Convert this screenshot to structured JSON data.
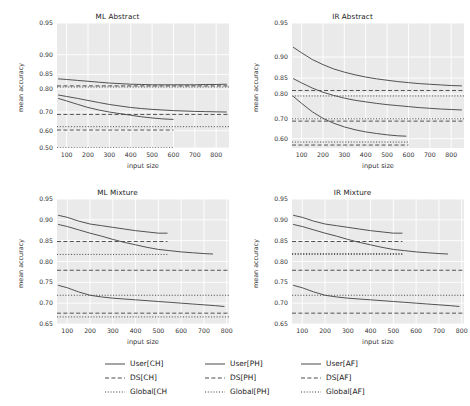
{
  "figure": {
    "width": 470,
    "height": 406,
    "background": "#ffffff",
    "panel_background": "#eaeaea",
    "grid_color": "#ffffff",
    "line_color": "#4a4a4a"
  },
  "legend": {
    "position": "bottom-center",
    "columns": 3,
    "entries": [
      {
        "label": "User[CH]",
        "style": "solid",
        "icon": "solid-line-icon"
      },
      {
        "label": "User[PH]",
        "style": "solid",
        "icon": "solid-line-icon"
      },
      {
        "label": "User[AF]",
        "style": "solid",
        "icon": "solid-line-icon"
      },
      {
        "label": "DS[CH]",
        "style": "dashed",
        "icon": "dashed-line-icon"
      },
      {
        "label": "DS[PH]",
        "style": "dashed",
        "icon": "dashed-line-icon"
      },
      {
        "label": "DS[AF]",
        "style": "dashed",
        "icon": "dashed-line-icon"
      },
      {
        "label": "Global[CH",
        "style": "dotted",
        "icon": "dotted-line-icon"
      },
      {
        "label": "Global[PH]",
        "style": "dotted",
        "icon": "dotted-line-icon"
      },
      {
        "label": "Global[AF]",
        "style": "dotted",
        "icon": "dotted-line-icon"
      }
    ]
  },
  "chart_data": [
    {
      "type": "line",
      "title": "ML Abstract",
      "xlabel": "input size",
      "ylabel": "mean accuracy",
      "grid": true,
      "xlim": [
        55,
        860
      ],
      "xticks": [
        100,
        200,
        300,
        400,
        500,
        600,
        700,
        800
      ],
      "yscale": "logit-like",
      "ylim": [
        0.5,
        0.95
      ],
      "yticks": [
        0.95,
        0.9,
        0.85,
        0.8,
        0.7,
        0.6,
        0.5
      ],
      "series": [
        {
          "name": "User[CH]",
          "style": "solid",
          "x": [
            60,
            100,
            150,
            200,
            250,
            300,
            350,
            400,
            450,
            500,
            550,
            600,
            650,
            700,
            750,
            800,
            850
          ],
          "y": [
            0.836,
            0.834,
            0.831,
            0.828,
            0.825,
            0.822,
            0.82,
            0.818,
            0.817,
            0.816,
            0.816,
            0.816,
            0.816,
            0.816,
            0.817,
            0.817,
            0.818
          ]
        },
        {
          "name": "User[PH]",
          "style": "solid",
          "x": [
            60,
            100,
            150,
            200,
            250,
            300,
            350,
            400,
            450,
            500,
            550,
            600,
            650,
            700,
            750,
            800,
            850
          ],
          "y": [
            0.777,
            0.771,
            0.763,
            0.754,
            0.745,
            0.736,
            0.729,
            0.722,
            0.717,
            0.713,
            0.71,
            0.707,
            0.705,
            0.703,
            0.702,
            0.701,
            0.7
          ]
        },
        {
          "name": "User[AF]",
          "style": "solid",
          "x": [
            60,
            100,
            150,
            200,
            250,
            300,
            350,
            400,
            450,
            500,
            550,
            600
          ],
          "y": [
            0.763,
            0.752,
            0.737,
            0.722,
            0.71,
            0.7,
            0.692,
            0.684,
            0.676,
            0.67,
            0.665,
            0.662
          ]
        },
        {
          "name": "DS[CH]",
          "style": "dashed",
          "level": 0.812,
          "x_end": 860
        },
        {
          "name": "DS[PH]",
          "style": "dashed",
          "level": 0.688,
          "x_end": 860
        },
        {
          "name": "DS[AF]",
          "style": "dashed",
          "level": 0.604,
          "x_end": 600
        },
        {
          "name": "Global[CH",
          "style": "dotted",
          "level": 0.808,
          "x_end": 860
        },
        {
          "name": "Global[PH]",
          "style": "dotted",
          "level": 0.623,
          "x_end": 860
        },
        {
          "name": "Global[AF]",
          "style": "dotted",
          "level": 0.501,
          "x_end": 600
        }
      ]
    },
    {
      "type": "line",
      "title": "IR Abstract",
      "xlabel": "input size",
      "ylabel": "mean accuracy",
      "grid": true,
      "xlim": [
        55,
        860
      ],
      "xticks": [
        100,
        200,
        300,
        400,
        500,
        600,
        700,
        800
      ],
      "yscale": "logit-like",
      "ylim": [
        0.55,
        0.95
      ],
      "yticks": [
        0.95,
        0.9,
        0.85,
        0.8,
        0.7,
        0.6
      ],
      "series": [
        {
          "name": "User[CH]",
          "style": "solid",
          "x": [
            60,
            100,
            150,
            200,
            250,
            300,
            350,
            400,
            450,
            500,
            550,
            600,
            650,
            700,
            750,
            800,
            850
          ],
          "y": [
            0.918,
            0.908,
            0.895,
            0.884,
            0.874,
            0.866,
            0.859,
            0.853,
            0.848,
            0.844,
            0.84,
            0.837,
            0.834,
            0.832,
            0.83,
            0.828,
            0.827
          ]
        },
        {
          "name": "User[PH]",
          "style": "solid",
          "x": [
            60,
            100,
            150,
            200,
            250,
            300,
            350,
            400,
            450,
            500,
            550,
            600,
            650,
            700,
            750,
            800,
            850
          ],
          "y": [
            0.849,
            0.836,
            0.82,
            0.806,
            0.795,
            0.785,
            0.777,
            0.771,
            0.765,
            0.76,
            0.756,
            0.752,
            0.748,
            0.745,
            0.742,
            0.74,
            0.738
          ]
        },
        {
          "name": "User[AF]",
          "style": "solid",
          "x": [
            60,
            100,
            150,
            200,
            250,
            300,
            350,
            400,
            450,
            500,
            550,
            590
          ],
          "y": [
            0.792,
            0.765,
            0.73,
            0.701,
            0.678,
            0.66,
            0.646,
            0.635,
            0.627,
            0.62,
            0.615,
            0.613
          ]
        },
        {
          "name": "DS[CH]",
          "style": "dashed",
          "level": 0.812,
          "x_end": 860
        },
        {
          "name": "DS[PH]",
          "style": "dashed",
          "level": 0.688,
          "x_end": 860
        },
        {
          "name": "DS[AF]",
          "style": "dashed",
          "level": 0.566,
          "x_end": 600
        },
        {
          "name": "Global[CH",
          "style": "dotted",
          "level": 0.793,
          "x_end": 860
        },
        {
          "name": "Global[PH]",
          "style": "dotted",
          "level": 0.699,
          "x_end": 860
        },
        {
          "name": "Global[AF]",
          "style": "dotted",
          "level": 0.582,
          "x_end": 600
        }
      ]
    },
    {
      "type": "line",
      "title": "ML Mixture",
      "xlabel": "input size",
      "ylabel": "mean accuracy",
      "grid": true,
      "xlim": [
        55,
        810
      ],
      "xticks": [
        100,
        200,
        300,
        400,
        500,
        600,
        700,
        800
      ],
      "yscale": "linear",
      "ylim": [
        0.65,
        0.95
      ],
      "yticks": [
        0.95,
        0.9,
        0.85,
        0.8,
        0.75,
        0.7,
        0.65
      ],
      "series": [
        {
          "name": "User[CH]",
          "style": "solid",
          "x": [
            60,
            100,
            150,
            200,
            250,
            300,
            350,
            400,
            450,
            500,
            540
          ],
          "y": [
            0.911,
            0.906,
            0.897,
            0.89,
            0.886,
            0.882,
            0.878,
            0.874,
            0.871,
            0.868,
            0.868
          ]
        },
        {
          "name": "User[PH]",
          "style": "solid",
          "x": [
            60,
            100,
            150,
            200,
            250,
            300,
            350,
            400,
            450,
            500,
            550,
            600,
            650,
            700,
            740
          ],
          "y": [
            0.889,
            0.884,
            0.876,
            0.868,
            0.861,
            0.853,
            0.846,
            0.84,
            0.834,
            0.829,
            0.826,
            0.823,
            0.821,
            0.819,
            0.818
          ]
        },
        {
          "name": "User[AF]",
          "style": "solid",
          "x": [
            60,
            100,
            150,
            200,
            250,
            300,
            350,
            400,
            450,
            500,
            550,
            600,
            650,
            700,
            750,
            790
          ],
          "y": [
            0.743,
            0.737,
            0.727,
            0.719,
            0.715,
            0.712,
            0.71,
            0.708,
            0.706,
            0.704,
            0.702,
            0.7,
            0.698,
            0.696,
            0.694,
            0.692
          ]
        },
        {
          "name": "DS[CH]",
          "style": "dashed",
          "level": 0.848,
          "x_end": 540
        },
        {
          "name": "DS[PH]",
          "style": "dashed",
          "level": 0.779,
          "x_end": 810
        },
        {
          "name": "DS[AF]",
          "style": "dashed",
          "level": 0.676,
          "x_end": 810
        },
        {
          "name": "Global[CH",
          "style": "dotted",
          "level": 0.817,
          "x_end": 540
        },
        {
          "name": "Global[PH]",
          "style": "dotted",
          "level": 0.719,
          "x_end": 810
        },
        {
          "name": "Global[AF]",
          "style": "dotted",
          "level": 0.667,
          "x_end": 810
        }
      ]
    },
    {
      "type": "line",
      "title": "IR Mixture",
      "xlabel": "input size",
      "ylabel": "mean accuracy",
      "grid": true,
      "xlim": [
        55,
        810
      ],
      "xticks": [
        100,
        200,
        300,
        400,
        500,
        600,
        700,
        800
      ],
      "yscale": "linear",
      "ylim": [
        0.65,
        0.95
      ],
      "yticks": [
        0.95,
        0.9,
        0.85,
        0.8,
        0.75,
        0.7,
        0.65
      ],
      "series": [
        {
          "name": "User[CH]",
          "style": "solid",
          "x": [
            60,
            100,
            150,
            200,
            250,
            300,
            350,
            400,
            450,
            500,
            540
          ],
          "y": [
            0.911,
            0.906,
            0.897,
            0.89,
            0.886,
            0.882,
            0.878,
            0.874,
            0.871,
            0.868,
            0.868
          ]
        },
        {
          "name": "User[PH]",
          "style": "solid",
          "x": [
            60,
            100,
            150,
            200,
            250,
            300,
            350,
            400,
            450,
            500,
            550,
            600,
            650,
            700,
            740
          ],
          "y": [
            0.889,
            0.884,
            0.876,
            0.868,
            0.861,
            0.853,
            0.846,
            0.84,
            0.834,
            0.829,
            0.826,
            0.823,
            0.821,
            0.819,
            0.818
          ]
        },
        {
          "name": "User[AF]",
          "style": "solid",
          "x": [
            60,
            100,
            150,
            200,
            250,
            300,
            350,
            400,
            450,
            500,
            550,
            600,
            650,
            700,
            750,
            790
          ],
          "y": [
            0.743,
            0.737,
            0.727,
            0.719,
            0.715,
            0.712,
            0.71,
            0.708,
            0.706,
            0.704,
            0.702,
            0.7,
            0.698,
            0.696,
            0.694,
            0.692
          ]
        },
        {
          "name": "DS[CH]",
          "style": "dashed",
          "level": 0.848,
          "x_end": 540
        },
        {
          "name": "DS[PH]",
          "style": "dashed",
          "level": 0.779,
          "x_end": 810
        },
        {
          "name": "DS[AF]",
          "style": "dashed",
          "level": 0.676,
          "x_end": 810
        },
        {
          "name": "Global[CH",
          "style": "dotted",
          "level": 0.817,
          "x_end": 540
        },
        {
          "name": "Global[PH]",
          "style": "dotted",
          "level": 0.819,
          "x_end": 540
        },
        {
          "name": "Global[AF]",
          "style": "dotted",
          "level": 0.719,
          "x_end": 810
        }
      ]
    }
  ]
}
